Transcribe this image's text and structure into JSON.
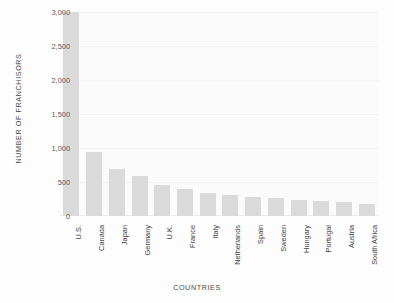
{
  "chart_data": {
    "type": "bar",
    "title": "",
    "xlabel": "Countries",
    "ylabel": "Number of Franchisors",
    "categories": [
      "U.S.",
      "Canada",
      "Japan",
      "Germany",
      "U.K.",
      "France",
      "Italy",
      "Netherlands",
      "Spain",
      "Sweden",
      "Hungary",
      "Portugal",
      "Austria",
      "South Africa"
    ],
    "values": [
      3000,
      940,
      690,
      590,
      450,
      400,
      340,
      310,
      280,
      260,
      240,
      220,
      200,
      180
    ],
    "ylim": [
      0,
      3000
    ],
    "yticks": [
      0,
      500,
      1000,
      1500,
      2000,
      2500,
      3000
    ],
    "ytick_labels": [
      "0",
      "500",
      "1,000",
      "1,500",
      "2,000",
      "2,500",
      "3,000"
    ],
    "grid": true,
    "legend": "none",
    "bar_color": "#dadada",
    "plot_background": "#fbfbfb",
    "page_background": "#ffffff",
    "axis_text_color": "#4a4a4a"
  }
}
